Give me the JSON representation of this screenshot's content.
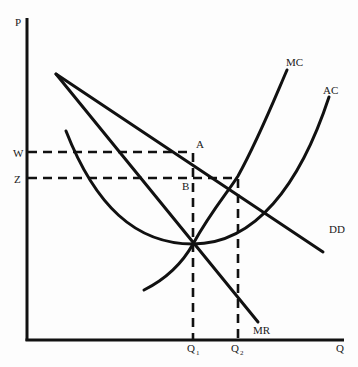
{
  "diagram": {
    "title": "",
    "axes": {
      "y_label": "P",
      "x_label": "Q"
    },
    "price_levels": [
      {
        "label": "W",
        "meaning": "price at point A on demand"
      },
      {
        "label": "Z",
        "meaning": "price at AC-DD intersection"
      }
    ],
    "quantities": [
      {
        "label": "Q",
        "sub": "1"
      },
      {
        "label": "Q",
        "sub": "2"
      }
    ],
    "curves": [
      {
        "id": "dd",
        "label": "DD"
      },
      {
        "id": "mr",
        "label": "MR"
      },
      {
        "id": "mc",
        "label": "MC"
      },
      {
        "id": "ac",
        "label": "AC"
      }
    ],
    "points": [
      {
        "label": "A"
      },
      {
        "label": "B"
      }
    ],
    "colors": {
      "ink": "#111111",
      "background": "#fdfdfd"
    }
  }
}
